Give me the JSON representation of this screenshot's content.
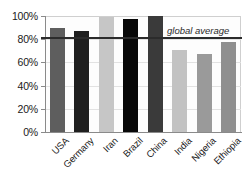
{
  "chart_data": {
    "type": "bar",
    "title": "",
    "xlabel": "",
    "ylabel": "",
    "categories": [
      "USA",
      "Germany",
      "Iran",
      "Brazil",
      "China",
      "India",
      "Nigeria",
      "Ethiopia"
    ],
    "values": [
      90,
      87,
      99,
      97,
      100,
      71,
      67,
      78
    ],
    "bar_colors": [
      "#5e5e5e",
      "#1f1f1f",
      "#c6c6c6",
      "#080808",
      "#3a3a3a",
      "#c2c2c2",
      "#9a9a9a",
      "#8f8f8f"
    ],
    "ylim": [
      0,
      100
    ],
    "ytick_labels": [
      "100%",
      "80%",
      "60%",
      "40%",
      "20%",
      "0%"
    ],
    "ytick_values": [
      100,
      80,
      60,
      40,
      20,
      0
    ],
    "grid": true,
    "legend": "none",
    "annotations": [
      {
        "label": "global average",
        "value": 81,
        "style": "italic",
        "line_color": "#2b2b2b"
      }
    ]
  },
  "axes": {
    "tick_color": "#8a8a8a",
    "grid_color": "#e2e2e2"
  },
  "plot": {
    "background": "#fdfdfd"
  }
}
